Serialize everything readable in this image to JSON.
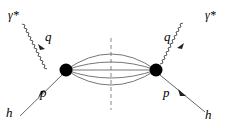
{
  "diagram": {
    "type": "feynman",
    "colors": {
      "line": "#555555",
      "blob": "#000000",
      "cut": "#888888"
    },
    "labels": {
      "photon_left": "γ*",
      "photon_right": "γ*",
      "q_left": "q",
      "q_right": "q",
      "p_left": "p",
      "p_right": "p",
      "h_left": "h",
      "h_right": "h"
    },
    "vertices": [
      {
        "name": "left-blob",
        "x": 66,
        "y": 70
      },
      {
        "name": "right-blob",
        "x": 156,
        "y": 70
      }
    ],
    "intermediate_lines": 5
  }
}
